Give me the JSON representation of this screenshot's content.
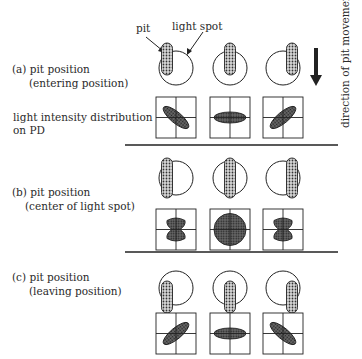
{
  "labels": {
    "pit": "pit",
    "light_spot": "light spot",
    "direction": "direction of pit movement",
    "intensity_line1": "light intensity distribution",
    "intensity_line2": "on PD"
  },
  "sections": [
    {
      "id": "a",
      "title_line1": "(a) pit position",
      "title_line2": "(entering position)",
      "pit_offsets": [
        "left",
        "center",
        "right"
      ],
      "pit_vertical": "top",
      "patterns": [
        "ellipse-tilt-down-right",
        "ellipse-horizontal",
        "ellipse-tilt-up-right"
      ]
    },
    {
      "id": "b",
      "title_line1": "(b) pit position",
      "title_line2": "(center of light spot)",
      "pit_offsets": [
        "left",
        "center",
        "right"
      ],
      "pit_vertical": "center",
      "patterns": [
        "hourglass",
        "full-circle",
        "hourglass"
      ]
    },
    {
      "id": "c",
      "title_line1": "(c) pit position",
      "title_line2": "(leaving position)",
      "pit_offsets": [
        "left",
        "center",
        "right"
      ],
      "pit_vertical": "bottom",
      "patterns": [
        "ellipse-tilt-up-right",
        "ellipse-horizontal",
        "ellipse-tilt-down-right"
      ]
    }
  ],
  "colors": {
    "line": "#222222",
    "fill_dark": "#555555",
    "fill_pit": "#9a9a9a"
  }
}
